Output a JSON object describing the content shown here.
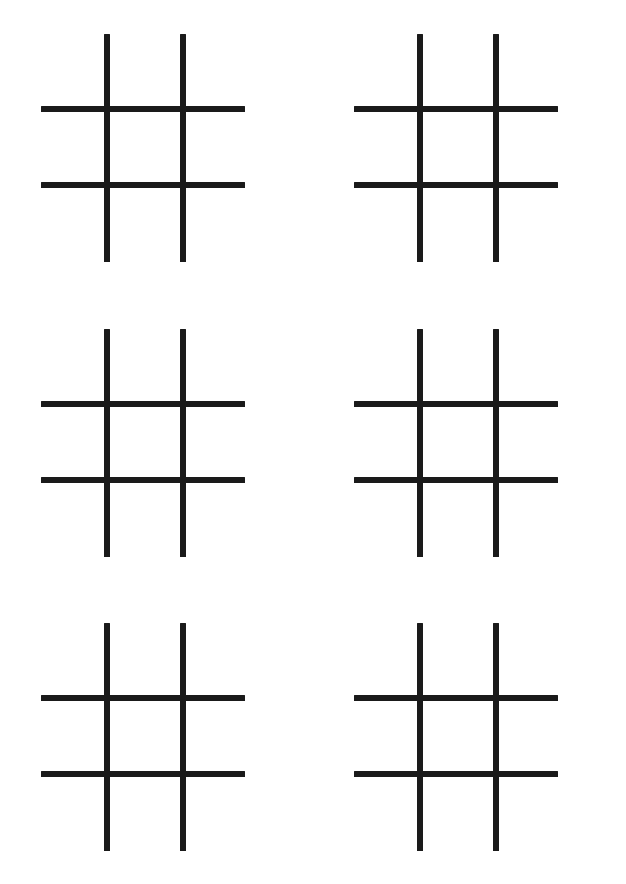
{
  "page": {
    "background_color": "#ffffff",
    "ink_color": "#1a1a1a",
    "width": 626,
    "height": 884
  },
  "layout": {
    "columns": 2,
    "rows": 3,
    "total_boards": 6,
    "description": "Six identical empty tic-tac-toe (hash) grids arranged two per row in three rows on a blank white page."
  },
  "board_template": {
    "name": "tic-tac-toe-grid",
    "vertical_lines": 2,
    "horizontal_lines": 2,
    "cells": 9,
    "stroke_width_px": 6,
    "stroke_color": "#1a1a1a",
    "filled": false
  },
  "boards": [
    {
      "id": "board-1",
      "position": "top-left",
      "row": 1,
      "column": 1,
      "marks": []
    },
    {
      "id": "board-2",
      "position": "top-right",
      "row": 1,
      "column": 2,
      "marks": []
    },
    {
      "id": "board-3",
      "position": "middle-left",
      "row": 2,
      "column": 1,
      "marks": []
    },
    {
      "id": "board-4",
      "position": "middle-right",
      "row": 2,
      "column": 2,
      "marks": []
    },
    {
      "id": "board-5",
      "position": "bottom-left",
      "row": 3,
      "column": 1,
      "marks": []
    },
    {
      "id": "board-6",
      "position": "bottom-right",
      "row": 3,
      "column": 2,
      "marks": []
    }
  ]
}
